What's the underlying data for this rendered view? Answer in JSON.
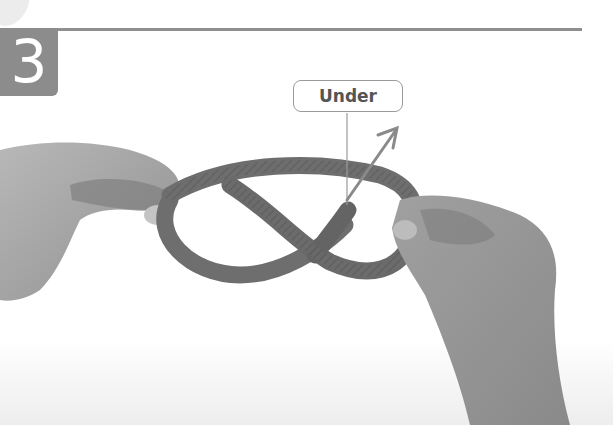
{
  "step": {
    "number": "3",
    "badge_color": "#8c8c8c",
    "rule_color": "#8f8f8f"
  },
  "callout": {
    "label": "Under",
    "border_color": "#9a9a9a",
    "text_color": "#555555"
  },
  "illustration": {
    "description": "Two hands holding a rope forming a figure-eight knot; arrow shows the rope end passing under",
    "rope_color": "#6e6e6e",
    "skin_color": "#a9a9a9",
    "arrow_color": "#8a8a8a"
  }
}
